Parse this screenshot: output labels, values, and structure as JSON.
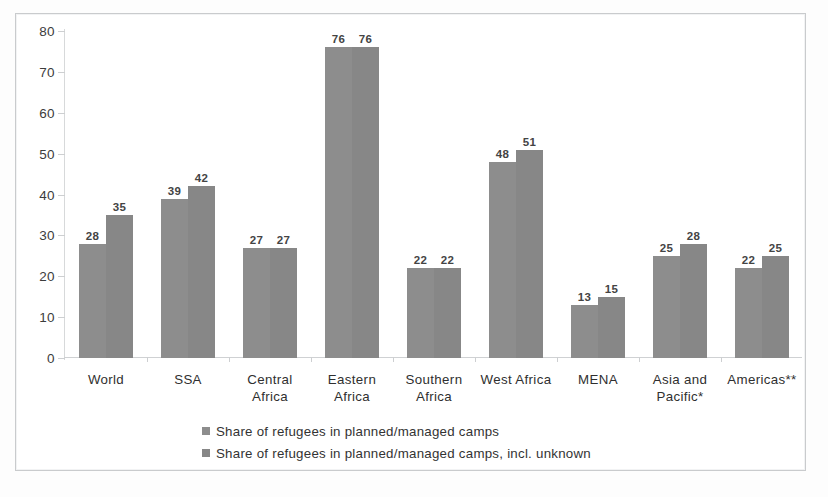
{
  "chart_data": {
    "type": "bar",
    "title": "",
    "subtitle": "",
    "xlabel": "",
    "ylabel": "",
    "ylim": [
      0,
      80
    ],
    "yticks": [
      0,
      10,
      20,
      30,
      40,
      50,
      60,
      70,
      80
    ],
    "grid": false,
    "legend_position": "bottom",
    "categories": [
      "World",
      "SSA",
      "Central Africa",
      "Eastern Africa",
      "Southern Africa",
      "West Africa",
      "MENA",
      "Asia and Pacific*",
      "Americas**"
    ],
    "category_lines": [
      [
        "World"
      ],
      [
        "SSA"
      ],
      [
        "Central",
        "Africa"
      ],
      [
        "Eastern",
        "Africa"
      ],
      [
        "Southern",
        "Africa"
      ],
      [
        "West Africa"
      ],
      [
        "MENA"
      ],
      [
        "Asia and",
        "Pacific*"
      ],
      [
        "Americas**"
      ]
    ],
    "series": [
      {
        "name": "Share of refugees in planned/managed camps",
        "color": "#8d8d8d",
        "values": [
          28,
          39,
          27,
          76,
          22,
          48,
          13,
          25,
          22
        ]
      },
      {
        "name": "Share of refugees in planned/managed camps, incl. unknown",
        "color": "#878787",
        "values": [
          35,
          42,
          27,
          76,
          22,
          51,
          15,
          28,
          25
        ]
      }
    ]
  },
  "legend": {
    "items": [
      {
        "label": "Share of refugees in planned/managed camps",
        "marker": "square-marker"
      },
      {
        "label": "Share of refugees in planned/managed camps, incl. unknown",
        "marker": "square-marker"
      }
    ]
  },
  "colors": {
    "series1": "#8d8d8d",
    "series2": "#878787",
    "axis": "#cfd1d3",
    "frame_border": "#c9cbcd",
    "text": "#333333",
    "background": "#ffffff"
  }
}
